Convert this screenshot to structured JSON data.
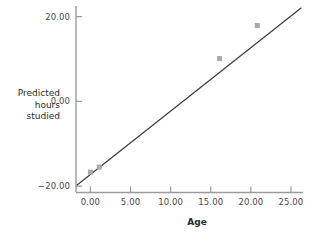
{
  "chart_data": {
    "type": "line",
    "title": "",
    "xlabel": "Age",
    "ylabel": "Predicted hours studied",
    "ylabel_lines": [
      "Predicted",
      "hours",
      "studied"
    ],
    "xlim": [
      -1.8,
      26.5
    ],
    "ylim": [
      -21.5,
      22.5
    ],
    "xticks": [
      0,
      5,
      10,
      15,
      20,
      25
    ],
    "xtick_labels": [
      "0.00",
      "5.00",
      "10.00",
      "15.00",
      "20.00",
      "25.00"
    ],
    "yticks": [
      -20,
      0,
      20
    ],
    "ytick_labels": [
      "−20.00",
      "0.00",
      "20.00"
    ],
    "grid": false,
    "legend": null,
    "series": [
      {
        "name": "Regression line",
        "type": "line",
        "color": "#3a3a3a",
        "x": [
          -1.7,
          26.3
        ],
        "y": [
          -19.8,
          22.1
        ]
      },
      {
        "name": "Observed points",
        "type": "scatter",
        "color": "#a9a9a9",
        "marker": "square",
        "x": [
          0.0,
          1.1,
          16.1,
          20.8
        ],
        "y": [
          -16.7,
          -15.5,
          10.1,
          17.9
        ]
      }
    ],
    "axis_color": "#9a9a9a",
    "line_color": "#3a3a3a",
    "marker_color": "#a9a9a9",
    "background": "#ffffff"
  }
}
